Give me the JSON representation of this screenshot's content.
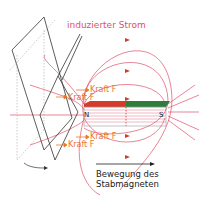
{
  "title": "induzierter Strom",
  "forces": [
    {
      "label": "Kraft F",
      "position": "upper-front"
    },
    {
      "label": "Kraft F",
      "position": "upper-back"
    },
    {
      "label": "Kraft F",
      "position": "lower-front"
    },
    {
      "label": "Kraft F",
      "position": "lower-back"
    }
  ],
  "magnet": {
    "north_label": "N",
    "south_label": "S",
    "north_color": "#d83a2a",
    "south_color": "#2e7d3a"
  },
  "motion_label": {
    "line1": "Bewegung des",
    "line2": "Stabmagneten"
  },
  "colors": {
    "field_lines": "#e0506a",
    "force": "#e8742f",
    "loop": "#333333"
  }
}
